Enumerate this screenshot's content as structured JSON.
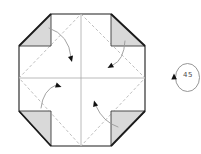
{
  "diagram": {
    "rotate_symbol": {
      "label": "45"
    },
    "colors": {
      "background": "#ffffff",
      "outline": "#1c1c1c",
      "flap_fill": "#d9d9d9",
      "flap_stroke": "#3a3a3a",
      "crease_solid": "#a8a8a8",
      "crease_dashed": "#b8b8b8",
      "arrow_line": "#999999",
      "arrow_head": "#111111",
      "rotate_circle": "#8a8a8a",
      "rotate_text": "#4a4a4a"
    },
    "paths": {
      "octagon": "M51,14 L111,14 L145,46 L145,111 L111,146 L51,146 L19,111 L19,46 Z",
      "center_vertical_crease": "M81,14 L81,146",
      "center_horizontal_crease": "M19,78 L145,78",
      "diamond_crease": "M81,14 L145,78 L81,146 L19,78 Z",
      "flap_top_left": "M51,14 L19,46 L51,46 Z",
      "flap_top_right": "M111,14 L145,46 L111,46 Z",
      "flap_bottom_left": "M19,111 L51,146 L51,111 Z",
      "flap_bottom_right": "M145,111 L111,146 L111,111 Z",
      "flap_edge_top_left": "M51,14 L19,46",
      "flap_edge_top_right": "M111,14 L145,46",
      "flap_edge_bottom_left": "M19,111 L51,146",
      "flap_edge_bottom_right": "M145,111 L111,146",
      "arrow_top_left": "M49,28 Q69,35 71,57",
      "arrow_head_top_left": "M72,62 L68,56.9 L73,55.5 Z",
      "arrow_top_right": "M125,41 Q124,60 113,65",
      "arrow_head_top_right": "M107.5,68 L111.4,62.7 L114,67.3 Z",
      "arrow_bottom_left": "M41,108 Q43,90 56,85",
      "arrow_head_bottom_left": "M61.5,87 L55,87.4 L56.7,82.5 Z",
      "arrow_bottom_right": "M118,127 Q103,122 96,106",
      "arrow_head_bottom_right": "M94,100.5 L98.1,105.6 L93.1,107 Z",
      "rotate_circle": "M199.5,77.5 A12,14 0 1 1 175.5,77.5 A12,14 0 1 1 199.5,77.5",
      "rotate_arrow_head": "M174,73.5 L171.3,79.6 L176.9,79.2 Z"
    }
  }
}
